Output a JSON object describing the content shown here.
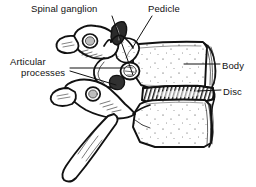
{
  "figure": {
    "kind": "anatomical-line-drawing",
    "background_color": "#ffffff",
    "ink_color": "#111111"
  },
  "labels": {
    "spinal_ganglion": "Spinal ganglion",
    "pedicle": "Pedicle",
    "articular_line1": "Articular",
    "articular_line2": "processes",
    "body": "Body",
    "disc": "Disc"
  },
  "structures": [
    {
      "name": "superior-vertebra-arch",
      "label_ref": "articular_processes"
    },
    {
      "name": "superior-articular-process",
      "label_ref": "articular_processes"
    },
    {
      "name": "inferior-articular-process",
      "label_ref": "articular_processes"
    },
    {
      "name": "pedicle",
      "label_ref": "pedicle"
    },
    {
      "name": "spinal-ganglion",
      "label_ref": "spinal_ganglion"
    },
    {
      "name": "vertebral-body-upper",
      "label_ref": "body"
    },
    {
      "name": "vertebral-body-lower",
      "label_ref": "body"
    },
    {
      "name": "intervertebral-disc",
      "label_ref": "disc"
    },
    {
      "name": "spinous-process-upper",
      "label_ref": null
    },
    {
      "name": "spinous-process-lower",
      "label_ref": null
    },
    {
      "name": "intervertebral-foramen",
      "label_ref": null
    }
  ],
  "leaders": [
    {
      "name": "leader-spinal-ganglion",
      "from": [
        112,
        17
      ],
      "to": [
        132,
        72
      ]
    },
    {
      "name": "leader-pedicle",
      "from": [
        152,
        17
      ],
      "to": [
        132,
        47
      ]
    },
    {
      "name": "leader-articular-upper",
      "from": [
        70,
        68
      ],
      "to": [
        124,
        68
      ]
    },
    {
      "name": "leader-articular-lower",
      "from": [
        70,
        72
      ],
      "to": [
        118,
        86
      ]
    },
    {
      "name": "leader-body",
      "from": [
        219,
        64
      ],
      "to": [
        185,
        64
      ]
    },
    {
      "name": "leader-disc",
      "from": [
        220,
        90
      ],
      "to": [
        196,
        90
      ]
    }
  ]
}
